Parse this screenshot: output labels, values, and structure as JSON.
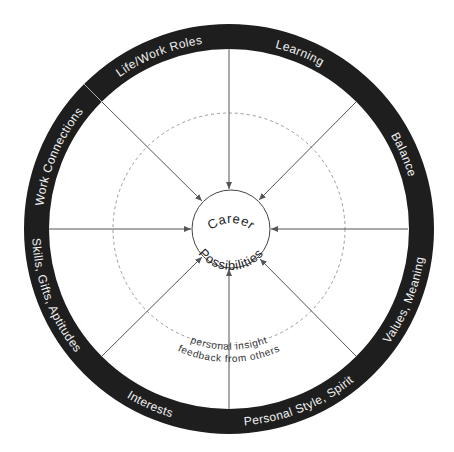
{
  "diagram": {
    "colors": {
      "ring": "#1e1e1e",
      "ring_text": "#f2f2f2",
      "spoke": "#555555",
      "dashed_circle": "#9a9a9a",
      "center_circle": "#444444",
      "background": "#ffffff"
    },
    "center": {
      "line1": "Career",
      "line2": "Possibilities"
    },
    "inner_band": {
      "inside_label": "personal insight",
      "outside_label": "feedback from others"
    },
    "ring_segments": [
      {
        "label": "Life/Work Roles",
        "angle": 338,
        "direction": "cw"
      },
      {
        "label": "Learning",
        "angle": 22,
        "direction": "cw"
      },
      {
        "label": "Balance",
        "angle": 67,
        "direction": "cw"
      },
      {
        "label": "Values, Meaning",
        "angle": 112,
        "direction": "ccw"
      },
      {
        "label": "Personal Style, Spirit",
        "angle": 158,
        "direction": "ccw"
      },
      {
        "label": "Interests",
        "angle": 204,
        "direction": "ccw"
      },
      {
        "label": "Skills, Gifts, Aptitudes",
        "angle": 249,
        "direction": "ccw"
      },
      {
        "label": "Work Connections",
        "angle": 293,
        "direction": "cw"
      }
    ],
    "spokes": {
      "count": 8,
      "angles": [
        0,
        45,
        90,
        135,
        180,
        225,
        270,
        315
      ],
      "arrowhead": "points to center"
    }
  }
}
